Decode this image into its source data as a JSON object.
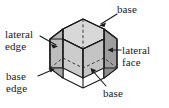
{
  "figure": {
    "shape": "hexagonal prism",
    "background_color": "#ffffff",
    "stroke_color": "#1a1a1a",
    "colors": {
      "top_face": "#d6d6d6",
      "front_face": "#cfcfcf",
      "left_face": "#b5b5b5",
      "right_face": "#b5b5b5",
      "far_right_face": "#9e9e9e",
      "outline": "#1a1a1a",
      "hidden_edge": "#555555",
      "text": "#1a1a1a"
    },
    "labels": [
      {
        "id": "base-top",
        "text": "base",
        "lines": [
          "base"
        ]
      },
      {
        "id": "lateral-edge",
        "text": "lateral edge",
        "lines": [
          "lateral",
          "edge"
        ]
      },
      {
        "id": "lateral-face",
        "text": "lateral face",
        "lines": [
          "lateral",
          "face"
        ]
      },
      {
        "id": "base-edge",
        "text": "base edge",
        "lines": [
          "base",
          "edge"
        ]
      },
      {
        "id": "base-bottom",
        "text": "base",
        "lines": [
          "base"
        ]
      }
    ],
    "leader_lines": [
      {
        "from": "base-top",
        "to": "top-hexagon-face"
      },
      {
        "from": "lateral-edge",
        "to": "left-vertical-edge"
      },
      {
        "from": "lateral-face",
        "to": "right-rectangular-face"
      },
      {
        "from": "base-edge",
        "to": "bottom-hexagon-edge"
      },
      {
        "from": "base-bottom",
        "to": "bottom-hexagon-face"
      }
    ]
  }
}
